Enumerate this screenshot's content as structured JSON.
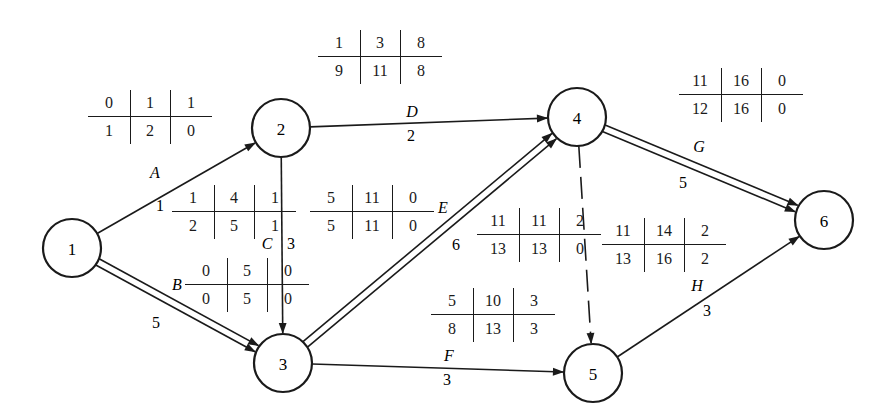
{
  "diagram": {
    "type": "activity-on-arrow network (CPM)",
    "table_legend_layout": [
      [
        "ES",
        "EF",
        "TF"
      ],
      [
        "LS",
        "LF",
        "FF"
      ]
    ],
    "nodes": [
      {
        "id": "1",
        "label": "1",
        "x": 72,
        "y": 248
      },
      {
        "id": "2",
        "label": "2",
        "x": 281,
        "y": 128
      },
      {
        "id": "3",
        "label": "3",
        "x": 283,
        "y": 363
      },
      {
        "id": "4",
        "label": "4",
        "x": 577,
        "y": 117
      },
      {
        "id": "5",
        "label": "5",
        "x": 593,
        "y": 373
      },
      {
        "id": "6",
        "label": "6",
        "x": 824,
        "y": 220
      }
    ],
    "activities": [
      {
        "name": "A",
        "from": "1",
        "to": "2",
        "duration": "1",
        "critical": false,
        "dummy": false
      },
      {
        "name": "B",
        "from": "1",
        "to": "3",
        "duration": "5",
        "critical": true,
        "dummy": false
      },
      {
        "name": "C",
        "from": "2",
        "to": "3",
        "duration": "3",
        "critical": false,
        "dummy": false
      },
      {
        "name": "D",
        "from": "2",
        "to": "4",
        "duration": "2",
        "critical": false,
        "dummy": false
      },
      {
        "name": "E",
        "from": "3",
        "to": "4",
        "duration": "6",
        "critical": true,
        "dummy": false
      },
      {
        "name": "F",
        "from": "3",
        "to": "5",
        "duration": "3",
        "critical": false,
        "dummy": false
      },
      {
        "name": "dummy",
        "from": "4",
        "to": "5",
        "duration": "",
        "critical": false,
        "dummy": true
      },
      {
        "name": "G",
        "from": "4",
        "to": "6",
        "duration": "5",
        "critical": true,
        "dummy": false
      },
      {
        "name": "H",
        "from": "5",
        "to": "6",
        "duration": "3",
        "critical": false,
        "dummy": false
      }
    ],
    "tables": [
      {
        "for": "A",
        "x": 88,
        "y": 88,
        "top": [
          "0",
          "1",
          "1"
        ],
        "bottom": [
          "1",
          "2",
          "0"
        ]
      },
      {
        "for": "A-inner",
        "x": 172,
        "y": 183,
        "top": [
          "1",
          "4",
          "1"
        ],
        "bottom": [
          "2",
          "5",
          "1"
        ]
      },
      {
        "for": "B",
        "x": 185,
        "y": 256,
        "top": [
          "0",
          "5",
          "0"
        ],
        "bottom": [
          "0",
          "5",
          "0"
        ]
      },
      {
        "for": "C",
        "x": 310,
        "y": 183,
        "top": [
          "5",
          "11",
          "0"
        ],
        "bottom": [
          "5",
          "11",
          "0"
        ]
      },
      {
        "for": "D",
        "x": 318,
        "y": 28,
        "top": [
          "1",
          "3",
          "8"
        ],
        "bottom": [
          "9",
          "11",
          "8"
        ]
      },
      {
        "for": "E",
        "x": 477,
        "y": 206,
        "top": [
          "11",
          "11",
          "2"
        ],
        "bottom": [
          "13",
          "13",
          "0"
        ]
      },
      {
        "for": "F",
        "x": 431,
        "y": 286,
        "top": [
          "5",
          "10",
          "3"
        ],
        "bottom": [
          "8",
          "13",
          "3"
        ]
      },
      {
        "for": "dummy",
        "x": 602,
        "y": 216,
        "top": [
          "11",
          "14",
          "2"
        ],
        "bottom": [
          "13",
          "16",
          "2"
        ]
      },
      {
        "for": "G",
        "x": 679,
        "y": 66,
        "top": [
          "11",
          "16",
          "0"
        ],
        "bottom": [
          "12",
          "16",
          "0"
        ]
      }
    ],
    "labels": [
      {
        "text": "A",
        "x": 155,
        "y": 178,
        "kind": "act"
      },
      {
        "text": "1",
        "x": 160,
        "y": 211,
        "kind": "dur"
      },
      {
        "text": "B",
        "x": 177,
        "y": 290,
        "kind": "act"
      },
      {
        "text": "5",
        "x": 156,
        "y": 328,
        "kind": "dur"
      },
      {
        "text": "C",
        "x": 267,
        "y": 249,
        "kind": "act"
      },
      {
        "text": "3",
        "x": 291,
        "y": 249,
        "kind": "dur"
      },
      {
        "text": "D",
        "x": 412,
        "y": 117,
        "kind": "act"
      },
      {
        "text": "2",
        "x": 411,
        "y": 141,
        "kind": "dur"
      },
      {
        "text": "E",
        "x": 443,
        "y": 213,
        "kind": "act"
      },
      {
        "text": "6",
        "x": 456,
        "y": 250,
        "kind": "dur"
      },
      {
        "text": "F",
        "x": 449,
        "y": 361,
        "kind": "act"
      },
      {
        "text": "3",
        "x": 447,
        "y": 385,
        "kind": "dur"
      },
      {
        "text": "G",
        "x": 699,
        "y": 152,
        "kind": "act"
      },
      {
        "text": "5",
        "x": 683,
        "y": 188,
        "kind": "dur"
      },
      {
        "text": "H",
        "x": 697,
        "y": 291,
        "kind": "act"
      },
      {
        "text": "3",
        "x": 707,
        "y": 316,
        "kind": "dur"
      }
    ]
  }
}
